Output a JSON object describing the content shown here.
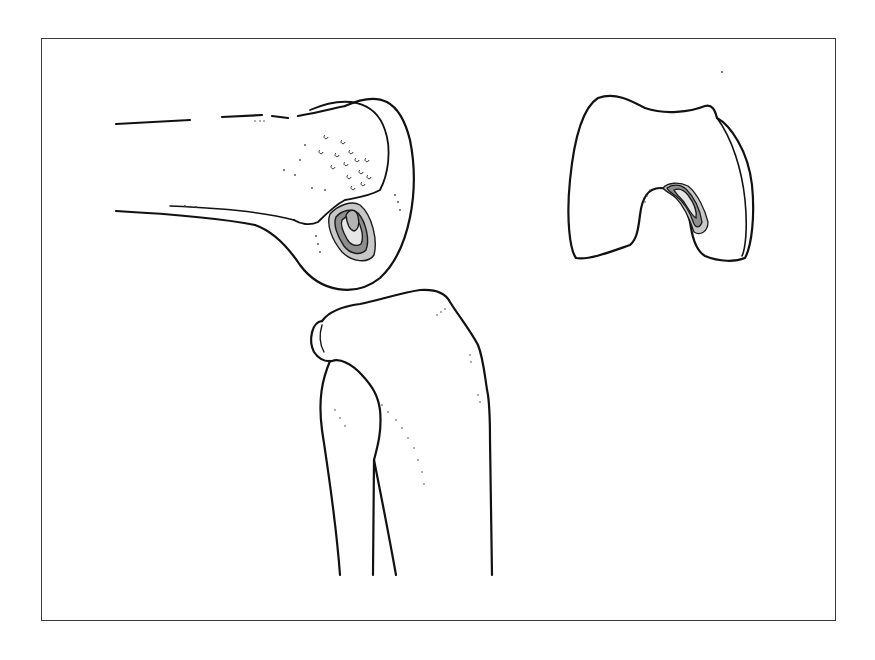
{
  "figure": {
    "panels": [
      {
        "name": "femur-lateral-view",
        "shows_lesion": true
      },
      {
        "name": "femur-frontal-view",
        "shows_lesion": true
      },
      {
        "name": "tibia-fibula-view",
        "shows_lesion": false
      }
    ],
    "colors": {
      "line": "#111111",
      "frame": "#3a3a3a",
      "lesion_outer": "#c8c8c8",
      "lesion_mid": "#8e8e8e",
      "lesion_inner": "#b4b4b4",
      "lesion_core": "#e6e6e6",
      "background": "#ffffff"
    }
  }
}
